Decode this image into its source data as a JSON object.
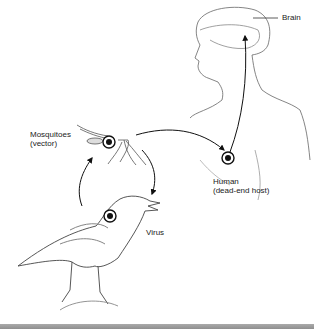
{
  "diagram": {
    "type": "transmission-cycle",
    "labels": {
      "brain": "Brain",
      "mosquitoes": "Mosquitoes\n(vector)",
      "human": "Human\n(dead-end host)",
      "virus": "Virus"
    },
    "nodes": [
      {
        "id": "mosquito",
        "label": "Mosquitoes (vector)"
      },
      {
        "id": "bird",
        "label": "Bird (reservoir host)"
      },
      {
        "id": "human",
        "label": "Human (dead-end host)"
      },
      {
        "id": "brain",
        "label": "Brain"
      }
    ],
    "edges": [
      {
        "from": "mosquito",
        "to": "human"
      },
      {
        "from": "mosquito",
        "to": "bird"
      },
      {
        "from": "bird",
        "to": "mosquito"
      },
      {
        "from": "human",
        "to": "brain"
      }
    ],
    "colors": {
      "line": "#222222",
      "sketch": "#555555",
      "bar": "#9a9a9a"
    }
  }
}
